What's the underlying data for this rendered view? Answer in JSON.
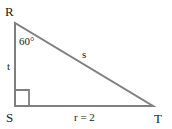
{
  "diagram": {
    "type": "right-triangle",
    "vertices": {
      "R": "R",
      "S": "S",
      "T": "T"
    },
    "angle_label": "60°",
    "sides": {
      "hypotenuse": "s",
      "vertical": "t",
      "horizontal": "r = 2"
    },
    "stroke_color": "#7f7f7f"
  }
}
